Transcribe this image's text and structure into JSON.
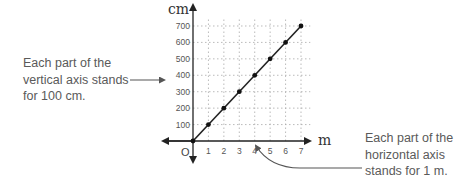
{
  "annotations": {
    "vertical": {
      "lines": [
        "Each part of the",
        "vertical axis stands",
        "for 100 cm."
      ]
    },
    "horizontal": {
      "lines": [
        "Each part of the",
        "horizontal axis",
        "stands for 1 m."
      ]
    }
  },
  "axes": {
    "x_unit": "m",
    "y_unit": "cm",
    "origin": "O",
    "x_ticks": [
      "1",
      "2",
      "3",
      "4",
      "5",
      "6",
      "7"
    ],
    "y_ticks": [
      "100",
      "200",
      "300",
      "400",
      "500",
      "600",
      "700"
    ]
  },
  "colors": {
    "line": "#222222",
    "grid": "#aaaaaa",
    "text": "#5a5a5a"
  },
  "chart_data": {
    "type": "line",
    "title": "",
    "xlabel": "m",
    "ylabel": "cm",
    "x": [
      0,
      1,
      2,
      3,
      4,
      5,
      6,
      7
    ],
    "values": [
      0,
      100,
      200,
      300,
      400,
      500,
      600,
      700
    ],
    "xlim": [
      0,
      7
    ],
    "ylim": [
      0,
      700
    ],
    "grid": true,
    "legend": null,
    "annotations": [
      "Each part of the vertical axis stands for 100 cm.",
      "Each part of the horizontal axis stands for 1 m."
    ]
  }
}
